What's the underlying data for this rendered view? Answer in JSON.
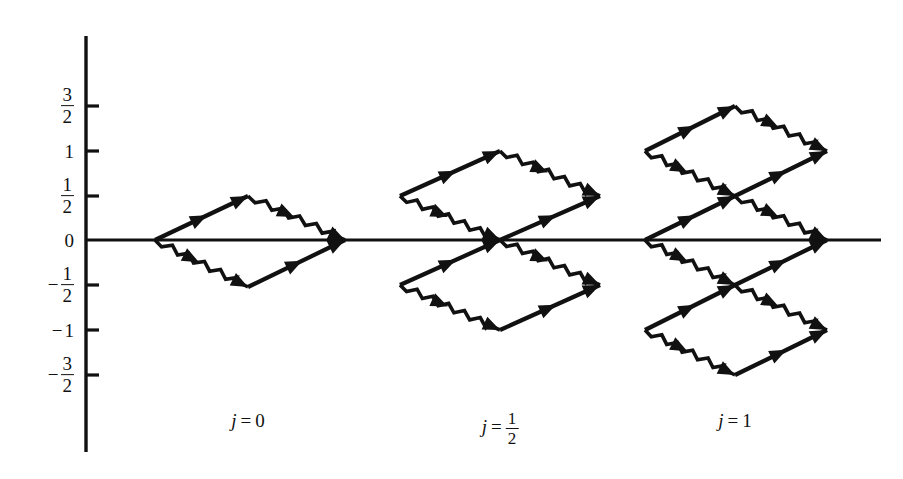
{
  "figure": {
    "background": "#ffffff",
    "ink": "#111111",
    "width": 903,
    "height": 479
  },
  "axes": {
    "y_axis": {
      "x": 86,
      "y_top": 36,
      "y_bottom": 452,
      "stroke_width": 3.4,
      "label": "m"
    },
    "x_axis": {
      "y": 240,
      "x_left": 86,
      "x_right": 881,
      "stroke_width": 3.0
    },
    "zero_y_px": 240,
    "unit_px": 88,
    "tick_length": 13,
    "ticks": [
      {
        "value": 1.5,
        "y": 106,
        "display": "3/2",
        "sign": "",
        "type": "fraction",
        "num": "3",
        "den": "2"
      },
      {
        "value": 1.0,
        "y": 151,
        "display": "1",
        "sign": "",
        "type": "whole",
        "whole": "1"
      },
      {
        "value": 0.5,
        "y": 196,
        "display": "1/2",
        "sign": "",
        "type": "fraction",
        "num": "1",
        "den": "2"
      },
      {
        "value": 0.0,
        "y": 240,
        "display": "0",
        "sign": "",
        "type": "whole",
        "whole": "0"
      },
      {
        "value": -0.5,
        "y": 285,
        "display": "-1/2",
        "sign": "−",
        "type": "fraction",
        "num": "1",
        "den": "2"
      },
      {
        "value": -1.0,
        "y": 330,
        "display": "-1",
        "sign": "−",
        "type": "whole",
        "whole": "1"
      },
      {
        "value": -1.5,
        "y": 375,
        "display": "-3/2",
        "sign": "−",
        "type": "fraction",
        "num": "3",
        "den": "2"
      }
    ],
    "tick_label_right_x": 74
  },
  "legend_semantics": {
    "solid_arrow": "raising step (straight arrow, up-and-right)",
    "zigzag_arrow": "lowering step (sawtooth / wavy arrow, down-and-right)"
  },
  "groups": [
    {
      "id": "j0",
      "label": {
        "symbol": "j",
        "equals": "=",
        "value": "0",
        "value_type": "whole"
      },
      "label_x": 248,
      "label_y": 410,
      "left_x": 155,
      "mid_x": 248,
      "right_x": 345,
      "diamonds": [
        {
          "center_m": 0.0,
          "left": [
            155,
            240
          ],
          "top": [
            248,
            196
          ],
          "right": [
            345,
            240
          ],
          "bottom": [
            248,
            287
          ]
        }
      ]
    },
    {
      "id": "jhalf",
      "label": {
        "symbol": "j",
        "equals": "=",
        "value": "1/2",
        "value_type": "fraction",
        "num": "1",
        "den": "2"
      },
      "label_x": 500,
      "label_y": 410,
      "left_x": 400,
      "mid_x": 500,
      "right_x": 600,
      "diamonds": [
        {
          "center_m": 0.5,
          "left": [
            400,
            196
          ],
          "top": [
            500,
            151
          ],
          "right": [
            600,
            196
          ],
          "bottom": [
            500,
            240
          ]
        },
        {
          "center_m": -0.5,
          "left": [
            400,
            285
          ],
          "top": [
            500,
            240
          ],
          "right": [
            600,
            285
          ],
          "bottom": [
            500,
            330
          ]
        }
      ]
    },
    {
      "id": "j1",
      "label": {
        "symbol": "j",
        "equals": "=",
        "value": "1",
        "value_type": "whole"
      },
      "label_x": 735,
      "label_y": 410,
      "left_x": 645,
      "mid_x": 735,
      "right_x": 827,
      "diamonds": [
        {
          "center_m": 1.0,
          "left": [
            645,
            151
          ],
          "top": [
            735,
            106
          ],
          "right": [
            827,
            151
          ],
          "bottom": [
            735,
            196
          ]
        },
        {
          "center_m": 0.0,
          "left": [
            645,
            240
          ],
          "top": [
            735,
            196
          ],
          "right": [
            827,
            240
          ],
          "bottom": [
            735,
            285
          ]
        },
        {
          "center_m": -1.0,
          "left": [
            645,
            330
          ],
          "top": [
            735,
            285
          ],
          "right": [
            827,
            330
          ],
          "bottom": [
            735,
            375
          ]
        }
      ]
    }
  ],
  "style": {
    "arrow_stroke_width": 4.2,
    "zigzag_stroke_width": 3.6,
    "zigzag_amplitude": 3.2,
    "zigzag_wavelength": 9.0,
    "arrowhead_length": 17,
    "arrowhead_halfwidth": 7
  }
}
